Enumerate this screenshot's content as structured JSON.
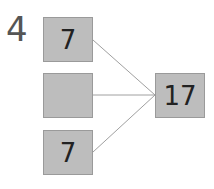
{
  "problem_number": "4",
  "boxes": {
    "left_top": "7",
    "left_middle": "",
    "left_bottom": "7",
    "right": "17"
  },
  "colors": {
    "box_fill": "#bdbdbd",
    "line": "#a0a0a0"
  }
}
